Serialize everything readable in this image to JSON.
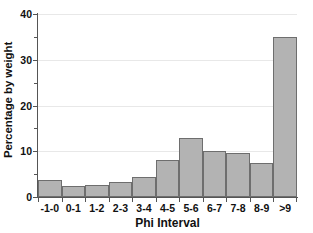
{
  "chart_data": {
    "type": "bar",
    "title": "",
    "xlabel": "Phi Interval",
    "ylabel": "Percentage by weight",
    "categories": [
      "-1-0",
      "0-1",
      "1-2",
      "2-3",
      "3-4",
      "4-5",
      "5-6",
      "6-7",
      "7-8",
      "8-9",
      ">9"
    ],
    "values": [
      3.8,
      2.5,
      2.6,
      3.2,
      4.3,
      8.0,
      12.8,
      10.1,
      9.7,
      7.4,
      35.0
    ],
    "ylim": [
      0,
      40
    ],
    "y_major_ticks": [
      0,
      10,
      20,
      30,
      40
    ],
    "y_minor_ticks": [
      5,
      15,
      25,
      35
    ],
    "y_tick_labels": [
      "0",
      "10",
      "20",
      "30",
      "40"
    ],
    "grid": true,
    "grid_axis": "y",
    "legend": "none",
    "bar_fill_color": "#b3b3b3",
    "bar_edge_color": "#6e6e6e",
    "gridline_color": "#e8e8e8",
    "axis_color": "#555555",
    "text_color": "#111111",
    "background_color": "#ffffff"
  }
}
